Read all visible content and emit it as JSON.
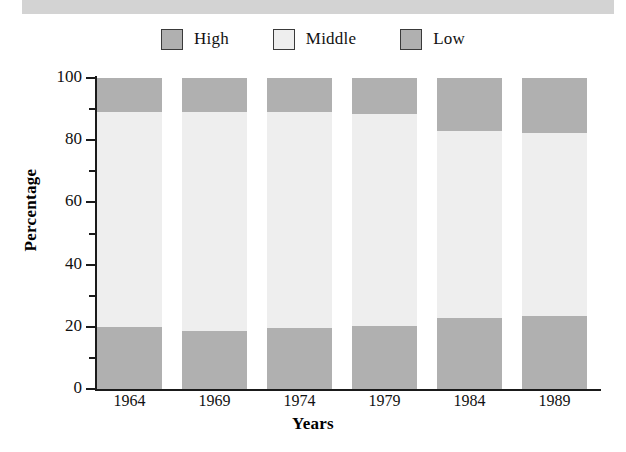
{
  "top_band": {
    "name": "cropped-header-band",
    "color": "#d3d3d3"
  },
  "legend": {
    "position": "top-center",
    "items": [
      {
        "label": "High",
        "color": "#b0b0b0",
        "border": "#3a3a3a"
      },
      {
        "label": "Middle",
        "color": "#eeeeee",
        "border": "#3a3a3a"
      },
      {
        "label": "Low",
        "color": "#b0b0b0",
        "border": "#3a3a3a"
      }
    ]
  },
  "chart_data": {
    "type": "bar",
    "subtype": "stacked-bar-100-percent",
    "title": "",
    "xlabel": "Years",
    "ylabel": "Percentage",
    "categories": [
      "1964",
      "1969",
      "1974",
      "1979",
      "1984",
      "1989"
    ],
    "ylim": [
      0,
      100
    ],
    "xlim_note": "categorical",
    "yticks": [
      0,
      20,
      40,
      60,
      80,
      100
    ],
    "ytick_labels": [
      "0",
      "20",
      "40",
      "60",
      "80",
      "100"
    ],
    "yticks_minor": [
      10,
      30,
      50,
      70,
      90
    ],
    "grid": false,
    "legend_position": "top-center",
    "stack_order_bottom_to_top": [
      "Low",
      "Middle",
      "High"
    ],
    "series": [
      {
        "name": "Low",
        "color": "#b0b0b0",
        "values": [
          20.0,
          18.6,
          19.6,
          20.3,
          22.8,
          23.5
        ]
      },
      {
        "name": "Middle",
        "color": "#eeeeee",
        "values": [
          69.1,
          70.5,
          69.5,
          68.1,
          60.2,
          58.8
        ]
      },
      {
        "name": "High",
        "color": "#b0b0b0",
        "values": [
          10.9,
          10.9,
          10.9,
          11.6,
          17.0,
          17.7
        ]
      }
    ]
  }
}
